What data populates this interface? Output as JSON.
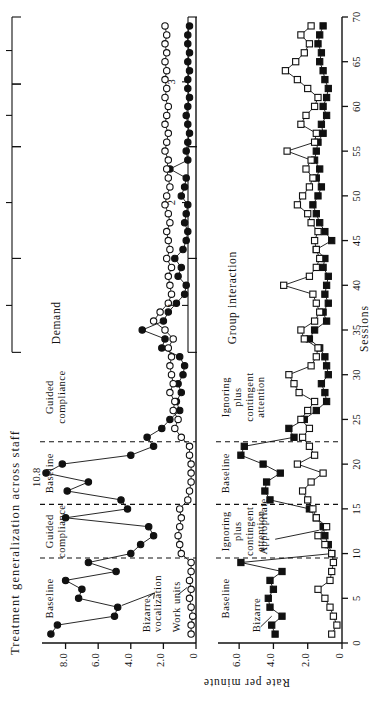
{
  "figure": {
    "title": "Treatment generalization across staff",
    "xlabel": "Sessions",
    "ylabel": "Rate per minute"
  },
  "chart_data": {
    "type": "line",
    "title": "Treatment generalization across staff",
    "xlabel": "Sessions",
    "ylabel": "Rate per minute",
    "xlim": [
      0,
      70
    ],
    "xticks": [
      0,
      5,
      10,
      15,
      20,
      25,
      30,
      35,
      40,
      45,
      50,
      55,
      60,
      65,
      70
    ],
    "grid": false,
    "legend": "inline-labels",
    "panels": [
      {
        "name": "top",
        "ylim": [
          0,
          9.2
        ],
        "yticks": [
          0,
          2.0,
          4.0,
          6.0,
          8.0
        ],
        "yticklabels": [
          "0",
          "2.0",
          "4.0",
          "6.0",
          "8.0"
        ],
        "condition_label": "Demand",
        "annotations": [
          {
            "text": "10.8",
            "x": 19,
            "y": 8.9
          }
        ],
        "phases": [
          {
            "label": "Baseline",
            "start": 0.5,
            "end": 9.5
          },
          {
            "label": "Guided\ncompliance",
            "start": 9.5,
            "end": 15.5
          },
          {
            "label": "Baseline",
            "start": 15.5,
            "end": 22.5
          },
          {
            "label": "Guided\ncompliance",
            "start": 22.5,
            "end": 32.5
          }
        ],
        "brackets": [
          {
            "label": "1",
            "start": 32.5,
            "end": 43.0
          },
          {
            "label": "2",
            "start": 43.0,
            "end": 55.5
          },
          {
            "label": "3",
            "start": 55.5,
            "end": 62.5
          },
          {
            "label": "4",
            "start": 62.5,
            "end": 70.0
          }
        ],
        "series": [
          {
            "name": "Bizarre vocalization",
            "marker": "filled-circle",
            "x": [
              1,
              2,
              3,
              4,
              5,
              6,
              7,
              8,
              9,
              10,
              11,
              12,
              13,
              14,
              15,
              16,
              17,
              18,
              19,
              20,
              21,
              22,
              23,
              24,
              25,
              26,
              27,
              28,
              29,
              30,
              31,
              32,
              33,
              34,
              35,
              36,
              37,
              38,
              39,
              40,
              41,
              42,
              43,
              44,
              45,
              46,
              47,
              48,
              49,
              50,
              51,
              52,
              53,
              54,
              55,
              56,
              57,
              58,
              59,
              60,
              61,
              62,
              63,
              64,
              65,
              66,
              67,
              68,
              69
            ],
            "y": [
              8.9,
              8.5,
              5.0,
              4.8,
              7.2,
              7.0,
              8.0,
              4.9,
              6.6,
              4.0,
              3.4,
              2.6,
              2.9,
              8.0,
              4.2,
              4.6,
              7.9,
              6.6,
              10.8,
              8.2,
              4.0,
              2.6,
              3.0,
              2.1,
              1.6,
              1.0,
              1.2,
              0.9,
              1.1,
              0.8,
              0.7,
              1.0,
              2.1,
              1.9,
              3.3,
              2.0,
              1.7,
              1.2,
              0.7,
              0.6,
              1.1,
              0.9,
              1.3,
              0.8,
              0.6,
              0.5,
              0.7,
              0.6,
              0.5,
              0.9,
              0.7,
              0.6,
              1.6,
              0.5,
              0.6,
              0.5,
              0.4,
              0.5,
              0.6,
              0.5,
              0.4,
              0.5,
              0.5,
              0.4,
              0.5,
              0.4,
              0.5,
              0.5,
              0.4
            ]
          },
          {
            "name": "Work units",
            "marker": "open-circle",
            "x": [
              1,
              2,
              3,
              4,
              5,
              6,
              7,
              8,
              9,
              10,
              11,
              12,
              13,
              14,
              15,
              16,
              17,
              18,
              19,
              20,
              21,
              22,
              23,
              24,
              25,
              26,
              27,
              28,
              29,
              30,
              31,
              32,
              33,
              34,
              35,
              36,
              37,
              38,
              39,
              40,
              41,
              42,
              43,
              44,
              45,
              46,
              47,
              48,
              49,
              50,
              51,
              52,
              53,
              54,
              55,
              56,
              57,
              58,
              59,
              60,
              61,
              62,
              63,
              64,
              65,
              66,
              67,
              68,
              69
            ],
            "y": [
              0.3,
              0.3,
              0.2,
              0.3,
              0.4,
              0.3,
              0.4,
              0.3,
              0.3,
              0.9,
              1.0,
              1.1,
              1.0,
              0.9,
              1.0,
              0.5,
              0.4,
              0.3,
              0.3,
              0.3,
              0.4,
              0.4,
              0.9,
              1.3,
              1.1,
              1.4,
              1.3,
              1.6,
              1.4,
              1.5,
              1.6,
              1.5,
              1.7,
              1.4,
              1.9,
              2.6,
              2.2,
              1.7,
              1.5,
              1.6,
              1.7,
              1.5,
              1.8,
              1.6,
              1.7,
              1.8,
              1.6,
              1.7,
              1.9,
              1.8,
              1.6,
              1.7,
              1.8,
              1.7,
              1.9,
              1.8,
              1.7,
              1.9,
              1.8,
              1.7,
              1.9,
              1.8,
              1.9,
              1.8,
              1.9,
              1.8,
              1.9,
              1.8,
              1.9
            ]
          }
        ]
      },
      {
        "name": "bottom",
        "ylim": [
          0,
          7.0
        ],
        "yticks": [
          0,
          2.0,
          4.0,
          6.0
        ],
        "yticklabels": [
          "0",
          "2.0",
          "4.0",
          "6.0"
        ],
        "condition_label": "Group interaction",
        "phases": [
          {
            "label": "Baseline",
            "start": 0.5,
            "end": 9.5
          },
          {
            "label": "Ignoring\nplus\ncontingent\nattention",
            "start": 9.5,
            "end": 15.5
          },
          {
            "label": "Baseline",
            "start": 15.5,
            "end": 22.5
          },
          {
            "label": "Ignoring\nplus\ncontingent\nattention",
            "start": 22.5,
            "end": 32.5
          }
        ],
        "brackets": [
          {
            "label": "1",
            "start": 32.5,
            "end": 43.0
          },
          {
            "label": "2",
            "start": 43.0,
            "end": 55.5
          },
          {
            "label": "3",
            "start": 55.5,
            "end": 70.0
          }
        ],
        "series": [
          {
            "name": "Bizarre",
            "marker": "filled-square",
            "x": [
              1,
              2,
              3,
              4,
              5,
              6,
              7,
              8,
              9,
              10,
              11,
              12,
              13,
              14,
              15,
              16,
              17,
              18,
              19,
              20,
              21,
              22,
              23,
              24,
              25,
              26,
              27,
              28,
              29,
              30,
              31,
              32,
              33,
              34,
              35,
              36,
              37,
              38,
              39,
              40,
              41,
              42,
              43,
              44,
              45,
              46,
              47,
              48,
              49,
              50,
              51,
              52,
              53,
              54,
              55,
              56,
              57,
              58,
              59,
              60,
              61,
              62,
              63,
              64,
              65,
              66,
              67,
              68,
              69
            ],
            "y": [
              3.9,
              4.1,
              3.5,
              4.2,
              4.3,
              4.0,
              4.2,
              3.5,
              5.9,
              0.6,
              0.8,
              1.0,
              1.1,
              1.5,
              1.9,
              4.2,
              4.5,
              4.4,
              3.6,
              4.6,
              5.9,
              5.7,
              2.8,
              3.1,
              2.2,
              1.5,
              0.9,
              1.0,
              1.2,
              0.8,
              0.9,
              1.0,
              1.3,
              1.9,
              1.6,
              0.9,
              1.1,
              0.8,
              1.0,
              0.9,
              0.8,
              1.1,
              1.0,
              1.5,
              0.6,
              1.0,
              1.3,
              1.5,
              1.7,
              1.4,
              1.2,
              1.5,
              1.3,
              1.6,
              1.5,
              1.4,
              1.1,
              1.2,
              0.9,
              1.1,
              0.9,
              0.8,
              1.0,
              1.1,
              1.3,
              1.2,
              1.4,
              1.3,
              1.1
            ]
          },
          {
            "name": "Appropriate",
            "marker": "open-square",
            "x": [
              1,
              2,
              3,
              4,
              5,
              6,
              7,
              8,
              9,
              10,
              11,
              12,
              13,
              14,
              15,
              16,
              17,
              18,
              19,
              20,
              21,
              22,
              23,
              24,
              25,
              26,
              27,
              28,
              29,
              30,
              31,
              32,
              33,
              34,
              35,
              36,
              37,
              38,
              39,
              40,
              41,
              42,
              43,
              44,
              45,
              46,
              47,
              48,
              49,
              50,
              51,
              52,
              53,
              54,
              55,
              56,
              57,
              58,
              59,
              60,
              61,
              62,
              63,
              64,
              65,
              66,
              67,
              68,
              69
            ],
            "y": [
              0.6,
              0.3,
              0.5,
              0.7,
              1.0,
              1.4,
              0.7,
              0.6,
              0.5,
              0.6,
              1.0,
              1.4,
              0.9,
              1.5,
              1.7,
              2.0,
              2.3,
              1.8,
              1.1,
              2.6,
              1.6,
              1.9,
              2.3,
              1.9,
              2.4,
              2.0,
              1.6,
              2.5,
              2.8,
              3.1,
              1.8,
              1.5,
              1.4,
              2.2,
              2.4,
              1.6,
              1.3,
              1.5,
              1.7,
              3.4,
              1.9,
              1.5,
              1.3,
              1.5,
              1.6,
              1.4,
              1.8,
              2.0,
              2.6,
              2.3,
              1.9,
              1.7,
              2.1,
              1.8,
              3.2,
              1.6,
              1.5,
              2.4,
              2.1,
              1.6,
              1.4,
              2.0,
              2.6,
              3.3,
              2.7,
              2.2,
              1.9,
              2.4,
              1.8
            ]
          }
        ]
      }
    ]
  }
}
